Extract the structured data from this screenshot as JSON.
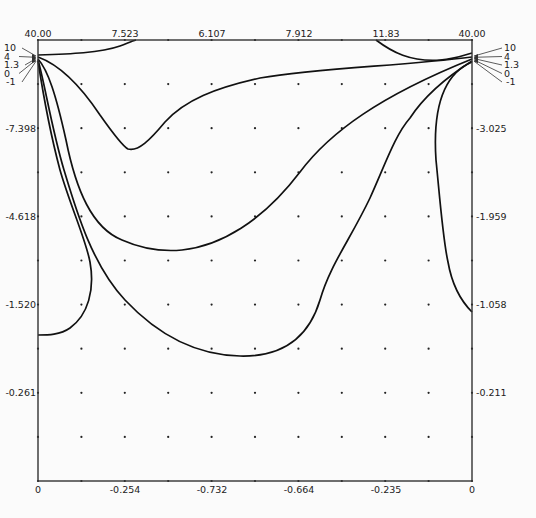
{
  "chart_data": {
    "type": "contour",
    "title": "",
    "xlabel": "",
    "ylabel": "",
    "frame": {
      "left": 38,
      "top": 40,
      "right": 472,
      "bottom": 481
    },
    "grid": {
      "nx": 10,
      "ny": 10,
      "dots": true
    },
    "top_axis_labels": [
      {
        "text": "40.00",
        "x": 38
      },
      {
        "text": "7.523",
        "x": 125
      },
      {
        "text": "6.107",
        "x": 212
      },
      {
        "text": "7.912",
        "x": 299
      },
      {
        "text": "11.83",
        "x": 386
      },
      {
        "text": "40.00",
        "x": 472
      }
    ],
    "bottom_axis_labels": [
      {
        "text": "0",
        "x": 38
      },
      {
        "text": "-0.254",
        "x": 125
      },
      {
        "text": "-0.732",
        "x": 212
      },
      {
        "text": "-0.664",
        "x": 299
      },
      {
        "text": "-0.235",
        "x": 386
      },
      {
        "text": "0",
        "x": 472
      }
    ],
    "left_axis_labels": [
      {
        "text": "-7.398",
        "y": 128
      },
      {
        "text": "-4.618",
        "y": 216
      },
      {
        "text": "-1.520",
        "y": 304
      },
      {
        "text": "-0.261",
        "y": 392
      }
    ],
    "right_axis_labels": [
      {
        "text": "-3.025",
        "y": 128
      },
      {
        "text": "-1.959",
        "y": 216
      },
      {
        "text": "-1.058",
        "y": 304
      },
      {
        "text": "-0.211",
        "y": 392
      }
    ],
    "contour_levels": [
      "10",
      "4",
      "1.3",
      "0",
      "-1"
    ],
    "contours": [
      {
        "level": "10",
        "paths": [
          "M38,55 C70,54 100,53 120,46 C128,43 132,41 136,40",
          "M376,40 C392,52 410,62 440,60 C455,59 465,55 472,53"
        ]
      },
      {
        "level": "4",
        "paths": [
          "M38,57 C60,65 80,85 100,115 C112,132 122,146 128,149 C138,152 150,140 165,122 C185,100 215,88 260,78 C320,68 400,66 472,57"
        ]
      },
      {
        "level": "1.3",
        "paths": [
          "M38,59 C48,70 56,95 66,140 C76,190 92,228 122,240 C140,248 160,252 182,250 C220,246 262,222 300,172 C330,132 380,96 472,59"
        ]
      },
      {
        "level": "0",
        "paths": [
          "M38,60 C44,80 52,130 64,170 C76,210 92,265 125,300 C155,332 192,355 240,356 C280,357 308,340 320,300 C330,265 350,240 370,198 C385,165 395,135 410,118 C425,95 450,75 472,61"
        ]
      },
      {
        "level": "-1",
        "paths": [
          "M38,61 C44,100 52,140 60,170 C70,205 86,240 90,262 C95,290 88,315 70,328 C60,335 48,335 38,335",
          "M472,62 C448,72 432,100 436,160 C440,200 443,240 448,262 C452,285 460,300 472,312"
        ]
      }
    ]
  }
}
